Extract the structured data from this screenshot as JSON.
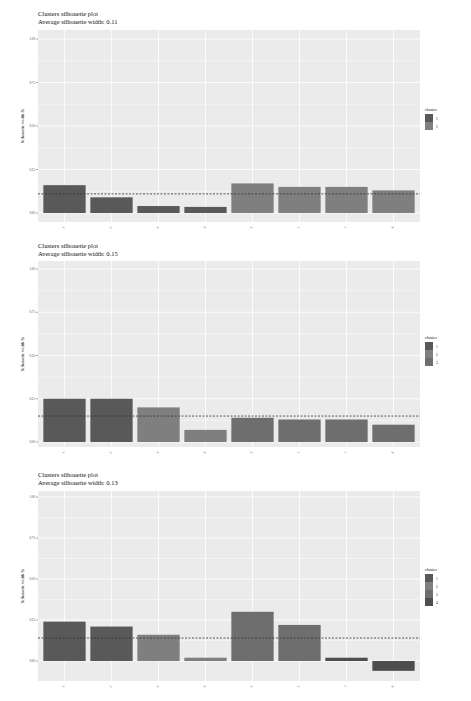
{
  "colors": {
    "panel_bg": "#ebebeb",
    "grid": "#ffffff",
    "cluster_1": "#595959",
    "cluster_2": "#7f7f7f",
    "cluster_3": "#6e6e6e",
    "cluster_4": "#4e4e4e",
    "dashed": "#333333"
  },
  "chart_data": [
    {
      "type": "bar",
      "title": "Clusters silhouette plot",
      "subtitle": "Average silhouette width: 0.11",
      "xlabel": "",
      "ylabel": "Silhouette width Si",
      "ylim": [
        0,
        1.05
      ],
      "yticks": [
        "0.00",
        "0.25",
        "0.50",
        "0.75",
        "1.00"
      ],
      "categories": [
        "1",
        "2",
        "3",
        "4",
        "5",
        "6",
        "7",
        "8"
      ],
      "values": [
        0.16,
        0.09,
        0.04,
        0.035,
        0.17,
        0.15,
        0.15,
        0.13
      ],
      "clusters": [
        "1",
        "1",
        "1",
        "1",
        "2",
        "2",
        "2",
        "2"
      ],
      "average": 0.11,
      "legend": {
        "title": "cluster",
        "entries": [
          "1",
          "2"
        ],
        "position": "right"
      },
      "grid": true
    },
    {
      "type": "bar",
      "title": "Clusters silhouette plot",
      "subtitle": "Average silhouette width: 0.15",
      "xlabel": "",
      "ylabel": "Silhouette width Si",
      "ylim": [
        0,
        1.05
      ],
      "yticks": [
        "0.00",
        "0.25",
        "0.50",
        "0.75",
        "1.00"
      ],
      "categories": [
        "1",
        "2",
        "3",
        "4",
        "5",
        "6",
        "7",
        "8"
      ],
      "values": [
        0.25,
        0.25,
        0.2,
        0.07,
        0.14,
        0.13,
        0.13,
        0.1
      ],
      "clusters": [
        "1",
        "1",
        "2",
        "2",
        "3",
        "3",
        "3",
        "3"
      ],
      "average": 0.15,
      "legend": {
        "title": "cluster",
        "entries": [
          "1",
          "2",
          "3"
        ],
        "position": "right"
      },
      "grid": true
    },
    {
      "type": "bar",
      "title": "Clusters silhouette plot",
      "subtitle": "Average silhouette width: 0.13",
      "xlabel": "",
      "ylabel": "Silhouette width Si",
      "ylim": [
        -0.08,
        1.05
      ],
      "yticks": [
        "0.00",
        "0.25",
        "0.50",
        "0.75",
        "1.00"
      ],
      "categories": [
        "1",
        "2",
        "3",
        "4",
        "5",
        "6",
        "7",
        "8"
      ],
      "values": [
        0.24,
        0.21,
        0.16,
        0.02,
        0.3,
        0.22,
        0.02,
        -0.06
      ],
      "clusters": [
        "1",
        "1",
        "2",
        "2",
        "3",
        "3",
        "4",
        "4"
      ],
      "average": 0.14,
      "legend": {
        "title": "cluster",
        "entries": [
          "1",
          "2",
          "3",
          "4"
        ],
        "position": "right"
      },
      "grid": true
    }
  ]
}
